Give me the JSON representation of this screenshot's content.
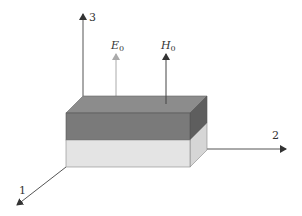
{
  "axes": {
    "axis1_label": "1",
    "axis2_label": "2",
    "axis3_label": "3"
  },
  "fields": {
    "e_field": {
      "symbol": "E",
      "subscript": "0"
    },
    "h_field": {
      "symbol": "H",
      "subscript": "0"
    }
  },
  "colors": {
    "top_layer": "#7a7a7a",
    "top_face": "#8c8c8c",
    "side_dark": "#5e5e5e",
    "bottom_layer": "#e4e4e4",
    "side_light": "#d6d6d6",
    "axis": "#555555",
    "e_arrow": "#aaaaaa"
  }
}
